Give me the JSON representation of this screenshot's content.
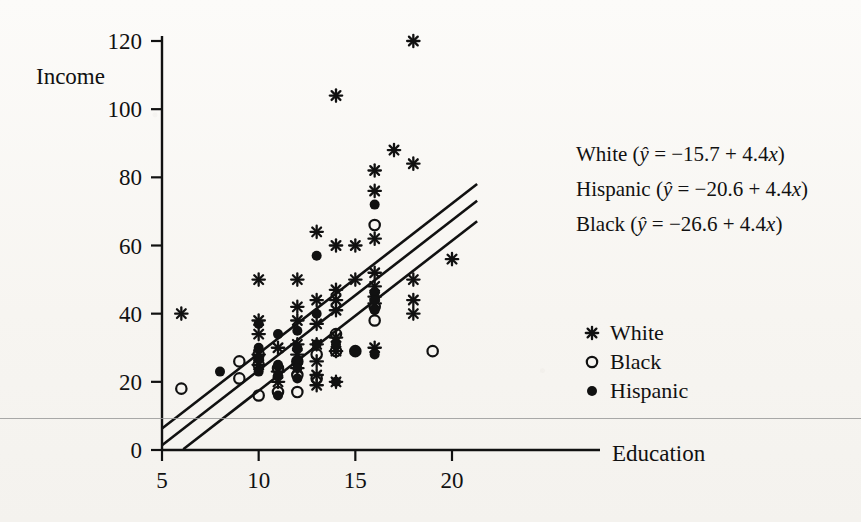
{
  "chart_data": {
    "type": "scatter",
    "title": "",
    "xlabel": "Education",
    "ylabel": "Income",
    "xlim": [
      4.0,
      22.2
    ],
    "ylim": [
      0,
      126
    ],
    "xticks": [
      5,
      10,
      15,
      20
    ],
    "yticks": [
      0,
      20,
      40,
      60,
      80,
      100,
      120
    ],
    "grid": false,
    "legend_position": "right",
    "series": [
      {
        "name": "White",
        "marker": "asterisk",
        "points": [
          [
            6,
            40
          ],
          [
            10,
            50
          ],
          [
            10,
            38
          ],
          [
            10,
            34
          ],
          [
            10,
            28
          ],
          [
            10,
            25
          ],
          [
            11,
            30
          ],
          [
            11,
            23
          ],
          [
            11,
            20
          ],
          [
            12,
            50
          ],
          [
            12,
            42
          ],
          [
            12,
            38
          ],
          [
            12,
            31
          ],
          [
            12,
            28
          ],
          [
            12,
            24
          ],
          [
            13,
            64
          ],
          [
            13,
            44
          ],
          [
            13,
            37
          ],
          [
            13,
            31
          ],
          [
            13,
            26
          ],
          [
            13,
            22
          ],
          [
            13,
            19
          ],
          [
            14,
            104
          ],
          [
            14,
            60
          ],
          [
            14,
            47
          ],
          [
            14,
            44
          ],
          [
            14,
            41
          ],
          [
            14,
            33
          ],
          [
            14,
            29
          ],
          [
            14,
            20
          ],
          [
            15,
            60
          ],
          [
            15,
            50
          ],
          [
            16,
            82
          ],
          [
            16,
            76
          ],
          [
            16,
            62
          ],
          [
            16,
            52
          ],
          [
            16,
            48
          ],
          [
            16,
            45
          ],
          [
            16,
            43
          ],
          [
            16,
            30
          ],
          [
            17,
            88
          ],
          [
            18,
            120
          ],
          [
            18,
            84
          ],
          [
            18,
            50
          ],
          [
            18,
            44
          ],
          [
            18,
            40
          ],
          [
            20,
            56
          ]
        ]
      },
      {
        "name": "Black",
        "marker": "open-circle",
        "points": [
          [
            6,
            18
          ],
          [
            9,
            26
          ],
          [
            9,
            21
          ],
          [
            10,
            28
          ],
          [
            10,
            25
          ],
          [
            10,
            16
          ],
          [
            11,
            24
          ],
          [
            11,
            17
          ],
          [
            12,
            26
          ],
          [
            12,
            22
          ],
          [
            12,
            17
          ],
          [
            13,
            28
          ],
          [
            13,
            21
          ],
          [
            14,
            34
          ],
          [
            14,
            29
          ],
          [
            15,
            29
          ],
          [
            16,
            66
          ],
          [
            16,
            42
          ],
          [
            16,
            38
          ],
          [
            19,
            29
          ]
        ]
      },
      {
        "name": "Hispanic",
        "marker": "filled-circle",
        "points": [
          [
            8,
            23
          ],
          [
            10,
            37
          ],
          [
            10,
            30
          ],
          [
            10,
            27
          ],
          [
            10,
            23
          ],
          [
            11,
            34
          ],
          [
            11,
            25
          ],
          [
            11,
            22
          ],
          [
            11,
            16
          ],
          [
            12,
            35
          ],
          [
            12,
            30
          ],
          [
            12,
            26
          ],
          [
            12,
            24
          ],
          [
            12,
            21
          ],
          [
            13,
            57
          ],
          [
            13,
            40
          ],
          [
            13,
            31
          ],
          [
            14,
            31
          ],
          [
            14,
            20
          ],
          [
            15,
            29
          ],
          [
            16,
            72
          ],
          [
            16,
            46
          ],
          [
            16,
            44
          ],
          [
            16,
            41
          ],
          [
            16,
            28
          ]
        ]
      }
    ],
    "regression_lines": [
      {
        "name": "White",
        "intercept": -15.7,
        "slope": 4.4,
        "x_start": 5.0,
        "x_end": 21.3
      },
      {
        "name": "Hispanic",
        "intercept": -20.6,
        "slope": 4.4,
        "x_start": 5.0,
        "x_end": 21.3
      },
      {
        "name": "Black",
        "intercept": -26.6,
        "slope": 4.4,
        "x_start": 6.1,
        "x_end": 21.3
      }
    ]
  },
  "axes": {
    "y_label": "Income",
    "x_label": "Education",
    "x_tick_labels": [
      "5",
      "10",
      "15",
      "20"
    ],
    "y_tick_labels": [
      "0",
      "20",
      "40",
      "60",
      "80",
      "100",
      "120"
    ]
  },
  "equations": [
    {
      "group": "White",
      "open": "(",
      "yhat": "ŷ",
      "eq": " = −15.7 + 4.4",
      "x": "x",
      "close": ")",
      "full": "White (ŷ = −15.7 + 4.4x)"
    },
    {
      "group": "Hispanic",
      "open": "(",
      "yhat": "ŷ",
      "eq": " = −20.6 + 4.4",
      "x": "x",
      "close": ")",
      "full": "Hispanic (ŷ = −20.6 + 4.4x)"
    },
    {
      "group": "Black",
      "open": "(",
      "yhat": "ŷ",
      "eq": " = −26.6 + 4.4",
      "x": "x",
      "close": ")",
      "full": "Black (ŷ = −26.6 + 4.4x)"
    }
  ],
  "legend": {
    "items": [
      {
        "label": "White",
        "marker": "asterisk",
        "marker_glyph": "∗"
      },
      {
        "label": "Black",
        "marker": "open-circle",
        "marker_glyph": "○"
      },
      {
        "label": "Hispanic",
        "marker": "filled-circle",
        "marker_glyph": "●"
      }
    ]
  },
  "colors": {
    "ink": "#111111",
    "paper": "#faf8f5",
    "artifact": "#9a9a9a"
  }
}
